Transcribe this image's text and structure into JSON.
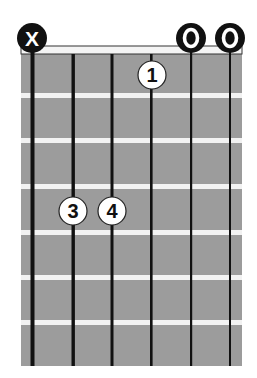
{
  "diagram": {
    "type": "guitar-chord-chart",
    "strings": 6,
    "frets_shown": 7,
    "colors": {
      "fretboard": "#9c9c9c",
      "fret_wire": "#f2f2f2",
      "string": "#111111",
      "nut_fill": "#f4f4f4",
      "nut_border": "#333333",
      "marker_fill": "#111111",
      "finger_fill": "#ffffff"
    },
    "string_markers": [
      {
        "string": 1,
        "symbol": "X",
        "meaning": "muted"
      },
      {
        "string": 2,
        "symbol": "",
        "meaning": "none"
      },
      {
        "string": 3,
        "symbol": "",
        "meaning": "none"
      },
      {
        "string": 4,
        "symbol": "",
        "meaning": "none"
      },
      {
        "string": 5,
        "symbol": "O",
        "meaning": "open"
      },
      {
        "string": 6,
        "symbol": "O",
        "meaning": "open"
      }
    ],
    "fingers": [
      {
        "finger": "1",
        "string": 4,
        "fret": 1
      },
      {
        "finger": "3",
        "string": 2,
        "fret": 4
      },
      {
        "finger": "4",
        "string": 3,
        "fret": 4
      }
    ]
  }
}
